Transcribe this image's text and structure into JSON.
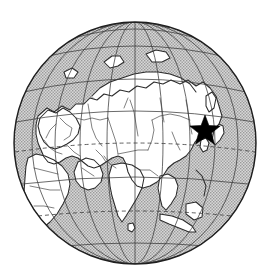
{
  "figure": {
    "projection": "orthographic",
    "background_color": "#ffffff",
    "ocean_color": "#b8b8b8",
    "land_color": "#ffffff",
    "coastline_color": "#2b2b2b",
    "border_color": "#4a4a4a",
    "graticule_color": "#3a3a3a",
    "marker_color": "#000000"
  },
  "globe": {
    "center_x": 135,
    "center_y": 143,
    "radius": 121,
    "projection_center_lon": 90,
    "projection_center_lat": 35
  },
  "graticule": {
    "meridian_spacing_deg": 20,
    "parallel_spacing_deg": 20,
    "meridians": [
      30,
      50,
      70,
      90,
      110,
      130,
      150
    ],
    "parallels": [
      -40,
      -20,
      0,
      20,
      40,
      60,
      80
    ],
    "equator_styled_dashed": true,
    "tropic_styled_dashed": true
  },
  "marker": {
    "name": "location-star",
    "shape": "five-pointed-star",
    "x": 205,
    "y": 131,
    "size": 32,
    "color": "#000000",
    "label": ""
  },
  "regions": {
    "landmasses": [
      "Eurasia",
      "Africa",
      "Arabian Peninsula",
      "Indian subcontinent",
      "Southeast Asian archipelago",
      "Japan",
      "Arctic islands"
    ],
    "oceans": [
      "Arctic Ocean",
      "Indian Ocean",
      "Pacific Ocean",
      "Atlantic Ocean",
      "Mediterranean Sea"
    ]
  }
}
